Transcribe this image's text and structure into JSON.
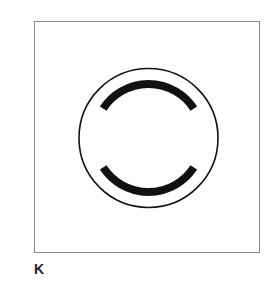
{
  "top_label": "I",
  "panel": {
    "label": "K",
    "figure": {
      "outer_circle": {
        "cx": 113.5,
        "cy": 116,
        "r": 69.5,
        "stroke": "#111111",
        "stroke_width": 1.6
      },
      "arcs": [
        {
          "name": "upper-arc",
          "r": 54,
          "start_deg": 147,
          "end_deg": 33,
          "stroke": "#111111",
          "stroke_width": 8
        },
        {
          "name": "lower-arc",
          "r": 54,
          "start_deg": 213,
          "end_deg": 327,
          "stroke": "#111111",
          "stroke_width": 8
        }
      ]
    }
  }
}
